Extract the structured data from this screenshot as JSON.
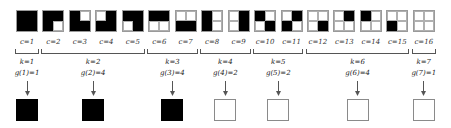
{
  "patterns": [
    {
      "c": "c=1",
      "cells": [
        1,
        1,
        1,
        1
      ]
    },
    {
      "c": "c=2",
      "cells": [
        1,
        1,
        1,
        0
      ]
    },
    {
      "c": "c=3",
      "cells": [
        1,
        0,
        1,
        1
      ]
    },
    {
      "c": "c=4",
      "cells": [
        0,
        1,
        1,
        1
      ]
    },
    {
      "c": "c=5",
      "cells": [
        1,
        1,
        0,
        1
      ]
    },
    {
      "c": "c=6",
      "cells": [
        1,
        1,
        0,
        0
      ]
    },
    {
      "c": "c=7",
      "cells": [
        0,
        0,
        1,
        1
      ]
    },
    {
      "c": "c=8",
      "cells": [
        1,
        0,
        1,
        0
      ]
    },
    {
      "c": "c=9",
      "cells": [
        0,
        1,
        0,
        1
      ]
    },
    {
      "c": "c=10",
      "cells": [
        1,
        0,
        0,
        1
      ]
    },
    {
      "c": "c=11",
      "cells": [
        0,
        1,
        1,
        0
      ]
    },
    {
      "c": "c=12",
      "cells": [
        0,
        0,
        0,
        1
      ]
    },
    {
      "c": "c=13",
      "cells": [
        0,
        1,
        0,
        0
      ]
    },
    {
      "c": "c=14",
      "cells": [
        1,
        0,
        0,
        0
      ]
    },
    {
      "c": "c=15",
      "cells": [
        0,
        0,
        1,
        0
      ]
    },
    {
      "c": "c=16",
      "cells": [
        0,
        0,
        0,
        0
      ]
    }
  ],
  "groups": [
    {
      "k": "k=1",
      "g": "g(1)=1",
      "from": 1,
      "to": 1,
      "output_filled": true
    },
    {
      "k": "k=2",
      "g": "g(2)=4",
      "from": 2,
      "to": 5,
      "output_filled": true
    },
    {
      "k": "k=3",
      "g": "g(3)=4",
      "from": 6,
      "to": 7,
      "output_filled": true
    },
    {
      "k": "k=4",
      "g": "g(4)=2",
      "from": 8,
      "to": 9,
      "output_filled": false
    },
    {
      "k": "k=5",
      "g": "g(5)=2",
      "from": 10,
      "to": 11,
      "output_filled": false
    },
    {
      "k": "k=6",
      "g": "g(6)=4",
      "from": 12,
      "to": 15,
      "output_filled": false
    },
    {
      "k": "k=7",
      "g": "g(7)=1",
      "from": 16,
      "to": 16,
      "output_filled": false
    }
  ],
  "colors": {
    "filled": "#000000",
    "empty": "#ffffff",
    "stroke": "#8a8a8a"
  }
}
